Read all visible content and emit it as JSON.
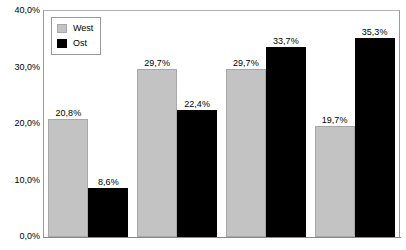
{
  "chart_data": {
    "type": "bar",
    "title": "",
    "xlabel": "",
    "ylabel": "",
    "ylim": [
      0,
      40
    ],
    "ytick_labels": [
      "40,0%",
      "30,0%",
      "20,0%",
      "10,0%",
      "0,0%"
    ],
    "ytick_values": [
      40,
      30,
      20,
      10,
      0
    ],
    "grid": false,
    "legend_position": "top-left-inside",
    "categories": [
      "",
      "",
      "",
      ""
    ],
    "series": [
      {
        "name": "West",
        "color": "#c3c3c3",
        "values": [
          20.8,
          29.7,
          29.7,
          19.7
        ],
        "labels": [
          "20,8%",
          "29,7%",
          "29,7%",
          "19,7%"
        ]
      },
      {
        "name": "Ost",
        "color": "#000000",
        "values": [
          8.6,
          22.4,
          33.7,
          35.3
        ],
        "labels": [
          "8,6%",
          "22,4%",
          "33,7%",
          "35,3%"
        ]
      }
    ]
  },
  "legend": {
    "items": [
      {
        "label": "West",
        "swatch": "west-color-swatch"
      },
      {
        "label": "Ost",
        "swatch": "ost-color-swatch"
      }
    ]
  },
  "colors": {
    "west": "#c3c3c3",
    "ost": "#000000",
    "frame": "#9a9a9a",
    "text": "#000000",
    "background": "#ffffff"
  }
}
